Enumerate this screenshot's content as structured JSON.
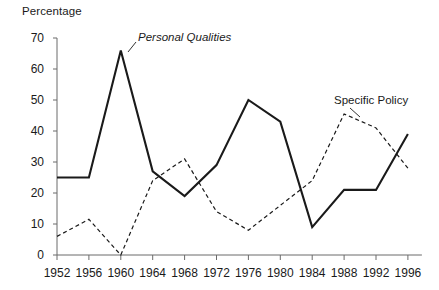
{
  "chart_data": {
    "type": "line",
    "title": "",
    "ylabel": "Percentage",
    "xlabel": "",
    "ylim": [
      0,
      70
    ],
    "ytick_step": 10,
    "yticks": [
      0,
      10,
      20,
      30,
      40,
      50,
      60,
      70
    ],
    "grid": false,
    "legend_position": "inline-annotations",
    "categories": [
      "1952",
      "1956",
      "1960",
      "1964",
      "1968",
      "1972",
      "1976",
      "1980",
      "1984",
      "1988",
      "1992",
      "1996"
    ],
    "x": [
      1952,
      1956,
      1960,
      1964,
      1968,
      1972,
      1976,
      1980,
      1984,
      1988,
      1992,
      1996
    ],
    "series": [
      {
        "name": "Personal Qualities",
        "style": "solid",
        "color": "#1a1a1a",
        "values": [
          25,
          25,
          66,
          27,
          19,
          29,
          50,
          43,
          9,
          21,
          21,
          39
        ],
        "annotation": "Personal Qualities",
        "annotation_x": 1960,
        "annotation_y": 68
      },
      {
        "name": "Specific Policy",
        "style": "dashed",
        "color": "#1a1a1a",
        "values": [
          6,
          11.5,
          0,
          24,
          31,
          14,
          8,
          16,
          24,
          45.5,
          41,
          28
        ],
        "annotation": "Specific Policy",
        "annotation_x": 1988,
        "annotation_y": 52
      }
    ]
  },
  "annotations": {
    "personal_qualities": "Personal Qualities",
    "specific_policy": "Specific Policy"
  },
  "axis": {
    "y_label": "Percentage",
    "y_tick_labels": [
      "0",
      "10",
      "20",
      "30",
      "40",
      "50",
      "60",
      "70"
    ],
    "x_tick_labels": [
      "1952",
      "1956",
      "1960",
      "1964",
      "1968",
      "1972",
      "1976",
      "1980",
      "1984",
      "1988",
      "1992",
      "1996"
    ]
  },
  "colors": {
    "ink": "#1a1a1a",
    "axis": "#6b6b6b",
    "background": "#ffffff"
  }
}
